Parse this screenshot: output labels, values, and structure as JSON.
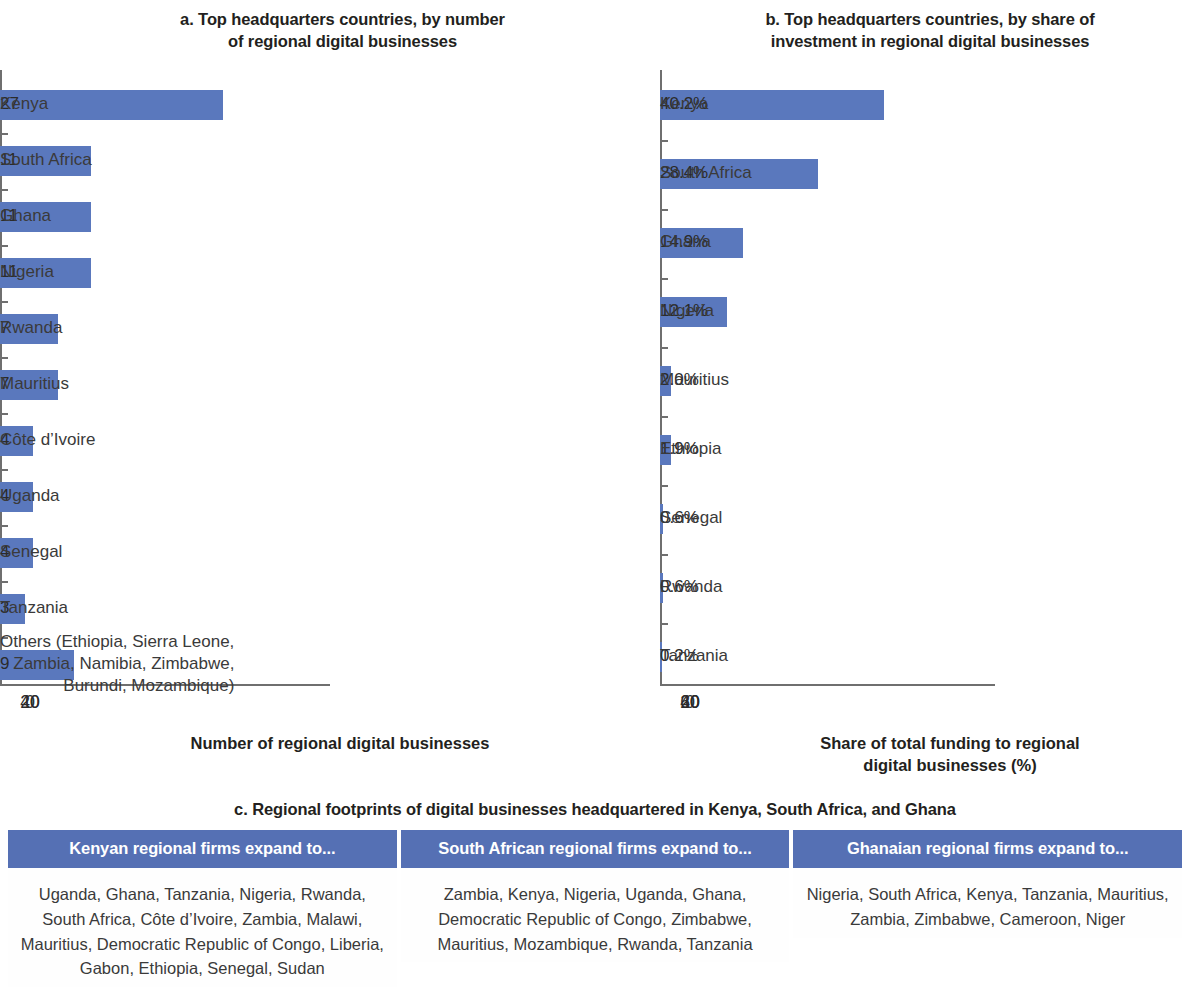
{
  "chart_data": [
    {
      "type": "bar",
      "panel": "a",
      "title": "a. Top headquarters countries, by number of regional digital businesses",
      "orientation": "horizontal",
      "categories": [
        "Kenya",
        "South Africa",
        "Ghana",
        "Nigeria",
        "Rwanda",
        "Mauritius",
        "Côte d’Ivoire",
        "Uganda",
        "Senegal",
        "Tanzania",
        "Others (Ethiopia, Sierra Leone,\nZambia, Namibia, Zimbabwe,\nBurundi, Mozambique)"
      ],
      "values": [
        27,
        11,
        11,
        11,
        7,
        7,
        4,
        4,
        4,
        3,
        9
      ],
      "value_labels": [
        "27",
        "11",
        "11",
        "11",
        "7",
        "7",
        "4",
        "4",
        "4",
        "3",
        "9"
      ],
      "xlabel": "Number of regional digital businesses",
      "ylabel": "",
      "xlim": [
        0,
        40
      ],
      "xticks": [
        0,
        20,
        40
      ],
      "xtick_labels": [
        "0",
        "20",
        "40"
      ],
      "grid": false,
      "legend": "none",
      "bar_color": "#5a78bd"
    },
    {
      "type": "bar",
      "panel": "b",
      "title": "b. Top headquarters countries, by share of investment in regional digital businesses",
      "orientation": "horizontal",
      "categories": [
        "Kenya",
        "South Africa",
        "Ghana",
        "Nigeria",
        "Mauritius",
        "Ethiopia",
        "Senegal",
        "Rwanda",
        "Tanzania"
      ],
      "values": [
        40.2,
        28.4,
        14.9,
        12.1,
        2.0,
        1.9,
        0.6,
        0.6,
        0.2
      ],
      "value_labels": [
        "40.2%",
        "28.4%",
        "14.9%",
        "12.1%",
        "2.0%",
        "1.9%",
        "0.6%",
        "0.6%",
        "0.2%"
      ],
      "xlabel": "Share of total funding to regional digital businesses (%)",
      "ylabel": "",
      "xlim": [
        0,
        60
      ],
      "xticks": [
        0,
        20,
        40,
        60
      ],
      "xtick_labels": [
        "0",
        "20",
        "40",
        "60"
      ],
      "grid": false,
      "legend": "none",
      "bar_color": "#5a78bd"
    },
    {
      "type": "table",
      "panel": "c",
      "title": "c. Regional footprints of digital businesses headquartered in Kenya, South Africa, and Ghana",
      "columns": [
        "Kenyan regional firms expand to...",
        "South African regional firms expand to...",
        "Ghanaian regional firms expand to..."
      ],
      "rows": [
        [
          "Uganda, Ghana, Tanzania, Nigeria, Rwanda, South Africa, Côte d’Ivoire, Zambia, Malawi, Mauritius, Democratic Republic of Congo, Liberia, Gabon, Ethiopia, Senegal, Sudan",
          "Zambia, Kenya, Nigeria, Uganda, Ghana, Democratic Republic of Congo, Zimbabwe, Mauritius, Mozambique, Rwanda, Tanzania",
          "Nigeria, South Africa, Kenya, Tanzania, Mauritius, Zambia, Zimbabwe, Cameroon, Niger"
        ]
      ],
      "header_color": "#5570b4"
    }
  ],
  "panel_a": {
    "title_line1": "a. Top headquarters countries, by number",
    "title_line2": "of regional digital businesses",
    "axis_title": "Number of regional digital businesses",
    "ticks": [
      "0",
      "20",
      "40"
    ],
    "bars": [
      {
        "label": "Kenya",
        "value": 27,
        "value_label": "27"
      },
      {
        "label": "South Africa",
        "value": 11,
        "value_label": "11"
      },
      {
        "label": "Ghana",
        "value": 11,
        "value_label": "11"
      },
      {
        "label": "Nigeria",
        "value": 11,
        "value_label": "11"
      },
      {
        "label": "Rwanda",
        "value": 7,
        "value_label": "7"
      },
      {
        "label": "Mauritius",
        "value": 7,
        "value_label": "7"
      },
      {
        "label": "Côte d’Ivoire",
        "value": 4,
        "value_label": "4"
      },
      {
        "label": "Uganda",
        "value": 4,
        "value_label": "4"
      },
      {
        "label": "Senegal",
        "value": 4,
        "value_label": "4"
      },
      {
        "label": "Tanzania",
        "value": 3,
        "value_label": "3"
      },
      {
        "label": "Others (Ethiopia, Sierra Leone,\nZambia, Namibia, Zimbabwe,\nBurundi, Mozambique)",
        "value": 9,
        "value_label": "9"
      }
    ]
  },
  "panel_b": {
    "title_line1": "b. Top headquarters countries, by share of",
    "title_line2": "investment in regional digital businesses",
    "axis_title_line1": "Share of total funding to regional",
    "axis_title_line2": "digital businesses (%)",
    "ticks": [
      "0",
      "20",
      "40",
      "60"
    ],
    "bars": [
      {
        "label": "Kenya",
        "value": 40.2,
        "value_label": "40.2%"
      },
      {
        "label": "South Africa",
        "value": 28.4,
        "value_label": "28.4%"
      },
      {
        "label": "Ghana",
        "value": 14.9,
        "value_label": "14.9%"
      },
      {
        "label": "Nigeria",
        "value": 12.1,
        "value_label": "12.1%"
      },
      {
        "label": "Mauritius",
        "value": 2.0,
        "value_label": "2.0%"
      },
      {
        "label": "Ethiopia",
        "value": 1.9,
        "value_label": "1.9%"
      },
      {
        "label": "Senegal",
        "value": 0.6,
        "value_label": "0.6%"
      },
      {
        "label": "Rwanda",
        "value": 0.6,
        "value_label": "0.6%"
      },
      {
        "label": "Tanzania",
        "value": 0.2,
        "value_label": "0.2%"
      }
    ]
  },
  "panel_c": {
    "title": "c. Regional footprints of digital businesses headquartered in Kenya, South Africa, and Ghana",
    "columns": [
      {
        "header": "Kenyan regional firms expand to...",
        "body": "Uganda, Ghana, Tanzania, Nigeria, Rwanda, South Africa, Côte d’Ivoire, Zambia, Malawi, Mauritius, Democratic Republic of Congo, Liberia, Gabon, Ethiopia, Senegal, Sudan"
      },
      {
        "header": "South African regional firms expand to...",
        "body": "Zambia, Kenya, Nigeria, Uganda, Ghana, Democratic Republic of Congo, Zimbabwe, Mauritius, Mozambique, Rwanda, Tanzania"
      },
      {
        "header": "Ghanaian regional firms expand to...",
        "body": "Nigeria, South Africa, Kenya, Tanzania, Mauritius, Zambia, Zimbabwe, Cameroon, Niger"
      }
    ]
  },
  "colors": {
    "bar": "#5a78bd",
    "table_header": "#5570b4",
    "axis": "#6f6f6f",
    "text": "#2b2b2b"
  }
}
